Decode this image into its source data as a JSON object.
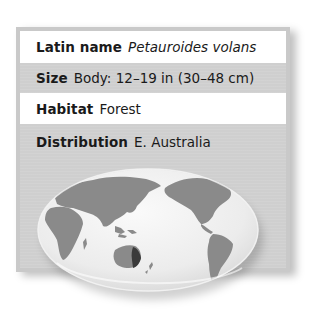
{
  "fact_card": {
    "rows": [
      {
        "label": "Latin name",
        "value": "Petauroides volans",
        "italic": true
      },
      {
        "label": "Size",
        "value": "Body: 12–19 in (30–48 cm)",
        "italic": false
      },
      {
        "label": "Habitat",
        "value": "Forest",
        "italic": false
      },
      {
        "label": "Distribution",
        "value": "E. Australia",
        "italic": false
      }
    ]
  },
  "map": {
    "icon": "world-map-globe",
    "highlighted_region": "E. Australia",
    "colors": {
      "ocean": "#f0f0f0",
      "land": "#8a8a8a",
      "highlight": "#3a3a3a",
      "card_gray": "#cfcfcf",
      "card_white": "#ffffff"
    }
  }
}
